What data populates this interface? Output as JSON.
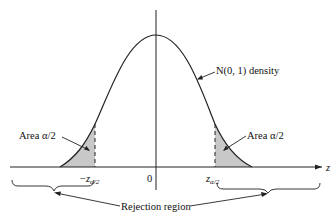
{
  "diagram": {
    "type": "normal-distribution-two-tailed-rejection",
    "curve_label": "N(0, 1) density",
    "left_area_label": "Area α/2",
    "right_area_label": "Area α/2",
    "x_axis_label": "z",
    "origin_label": "0",
    "left_critical": {
      "sign": "−",
      "base": "z",
      "subscript": "α/2"
    },
    "right_critical": {
      "base": "z",
      "subscript": "α/2"
    },
    "rejection_label": "Rejection region",
    "colors": {
      "line": "#222222",
      "shade": "#c8c8c8",
      "background": "#ffffff"
    }
  }
}
